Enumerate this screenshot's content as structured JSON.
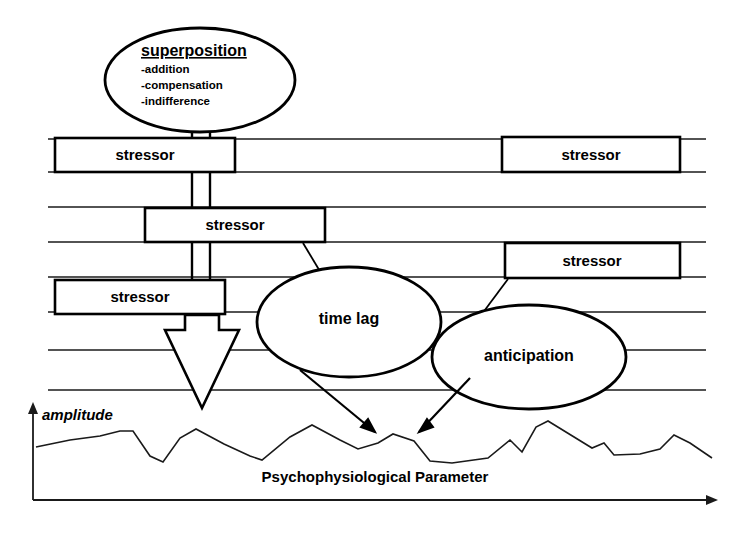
{
  "diagram": {
    "background_color": "#ffffff",
    "line_color": "#000000"
  },
  "superposition_node": {
    "title": "superposition",
    "items": [
      "-addition",
      "-compensation",
      "-indifference"
    ],
    "shape": "ellipse"
  },
  "stressor_boxes": [
    {
      "label": "stressor",
      "id": "stressor-left-1"
    },
    {
      "label": "stressor",
      "id": "stressor-left-2"
    },
    {
      "label": "stressor",
      "id": "stressor-left-3"
    },
    {
      "label": "stressor",
      "id": "stressor-right-1"
    },
    {
      "label": "stressor",
      "id": "stressor-right-2"
    }
  ],
  "annotation_ellipses": [
    {
      "label": "time lag",
      "id": "time-lag-ellipse"
    },
    {
      "label": "anticipation",
      "id": "anticipation-ellipse"
    }
  ],
  "axes": {
    "y_label": "amplitude",
    "x_label": "Psychophysiological Parameter"
  },
  "chart_data": {
    "type": "line",
    "title": "",
    "xlabel": "Psychophysiological Parameter",
    "ylabel": "amplitude",
    "grid": false,
    "legend": "none",
    "series": [
      {
        "name": "psychophysiological signal",
        "points": [
          [
            36,
            447
          ],
          [
            70,
            440
          ],
          [
            100,
            436
          ],
          [
            120,
            431
          ],
          [
            133,
            431
          ],
          [
            150,
            456
          ],
          [
            163,
            462
          ],
          [
            180,
            438
          ],
          [
            196,
            429
          ],
          [
            224,
            444
          ],
          [
            250,
            456
          ],
          [
            262,
            460
          ],
          [
            290,
            437
          ],
          [
            312,
            425
          ],
          [
            340,
            440
          ],
          [
            358,
            449
          ],
          [
            378,
            443
          ],
          [
            393,
            434
          ],
          [
            414,
            441
          ],
          [
            430,
            461
          ],
          [
            452,
            463
          ],
          [
            488,
            458
          ],
          [
            510,
            440
          ],
          [
            522,
            452
          ],
          [
            536,
            427
          ],
          [
            548,
            421
          ],
          [
            592,
            448
          ],
          [
            604,
            443
          ],
          [
            614,
            455
          ],
          [
            640,
            454
          ],
          [
            660,
            449
          ],
          [
            674,
            435
          ],
          [
            690,
            443
          ],
          [
            712,
            458
          ]
        ]
      }
    ]
  },
  "horizontal_lines": {
    "count": 8,
    "description": "parallel horizontal timeline rails crossing the figure"
  },
  "arrows": {
    "big_down_arrow": "hollow downward arrow from third stressor to waveform",
    "time_lag_arrow": "arrow from time lag ellipse to waveform",
    "anticipation_arrow": "arrow from anticipation ellipse to waveform"
  }
}
